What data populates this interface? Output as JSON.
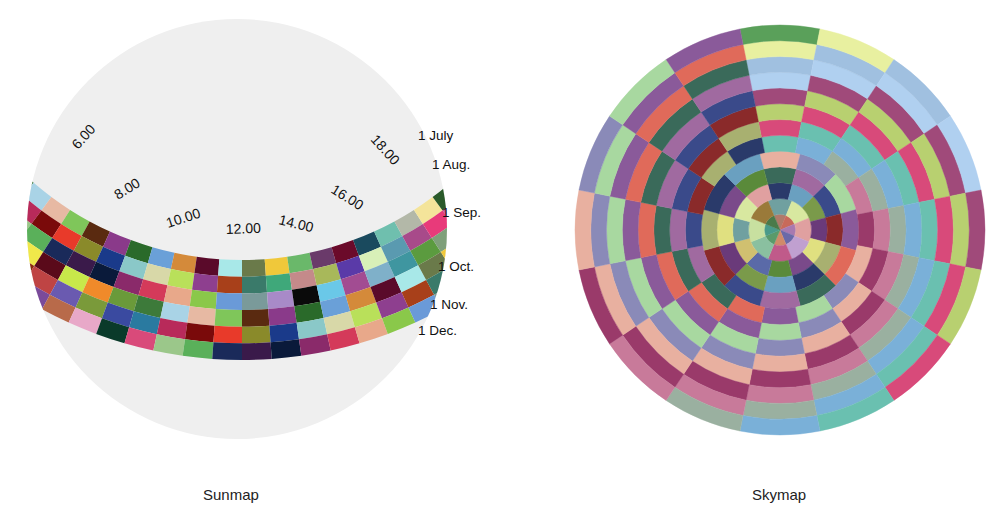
{
  "sunmap": {
    "caption": "Sunmap",
    "disc_color": "#efefef",
    "hour_labels": [
      "6.00",
      "8.00",
      "10.00",
      "12.00",
      "14.00",
      "16.00",
      "18.00"
    ],
    "month_labels": [
      "1 July",
      "1 Aug.",
      "1 Sep.",
      "1 Oct.",
      "1 Nov.",
      "1 Dec."
    ],
    "palette": [
      "#3d7a3a",
      "#6b0a2a",
      "#d94a7a",
      "#a24c92",
      "#3a3a8f",
      "#b9e05a",
      "#d7a2c2",
      "#a9d3e6",
      "#1a4a5e",
      "#9bc78a",
      "#7fb0c9",
      "#8c3f8f",
      "#8e3f8f",
      "#a3cf7a",
      "#e7b9a3",
      "#6fbfae",
      "#5ab05a",
      "#3f96a0",
      "#8a2c0c",
      "#a8401a",
      "#8a7a2a",
      "#7fc65a",
      "#b3b8a8",
      "#1a2a5a",
      "#5b9b3f",
      "#bf4444",
      "#3a7a6a",
      "#9a8ab5",
      "#5a2a10",
      "#f4e49a",
      "#3a1a4a",
      "#7fa07a",
      "#6a5ab0",
      "#3fa87a",
      "#8ac64a",
      "#8a3a8a",
      "#2a5a2a",
      "#0a1a3a",
      "#4a5a4a",
      "#7a9a3a",
      "#c48a8a",
      "#d4a46a",
      "#2a6a2a",
      "#d43a3a",
      "#8a2a6a",
      "#a8a8c8",
      "#3a4aa0",
      "#a8b85a",
      "#1a1a4a",
      "#6aa0d8",
      "#5a3a8a",
      "#d43a5a",
      "#4a5a6a",
      "#2a7aa0",
      "#5a3aa8",
      "#ffffff",
      "#d48a3a",
      "#a89a7a",
      "#e8a88a",
      "#a8d88a",
      "#b82a5a",
      "#d8f0b8",
      "#e84a1a",
      "#5a0a2a",
      "#a85aa8",
      "#8ac84a",
      "#5a0a6a",
      "#7a0a0a",
      "#5a9ab0",
      "#f0e84a",
      "#a8e8e8",
      "#3a9a4a",
      "#6a9ad8",
      "#4a3aa0",
      "#e83a2a",
      "#a84a8a",
      "#5a0a1a",
      "#6a7a4a",
      "#7a4a9a",
      "#7a9a9a",
      "#8a0a1a",
      "#8a8a2a",
      "#e83a7a",
      "#c8e84a",
      "#f0c83a",
      "#b86a4a",
      "#a88ac8",
      "#6a8ad8",
      "#1a3a8a",
      "#c85a9a",
      "#f08a2a",
      "#6ab86a",
      "#e8a8c8",
      "#0a0a0a",
      "#e8e8c8",
      "#8ac8c8",
      "#5a3a2a",
      "#6a9a3a",
      "#6a3a6a",
      "#0a3a2a",
      "#6ac8e8",
      "#1a5a8a",
      "#d8d8a8",
      "#c86a6a"
    ]
  },
  "skymap": {
    "caption": "Skymap",
    "rings": 13,
    "sectors_outer": 16,
    "palette": [
      "#b07a6a",
      "#7a4a8a",
      "#a8d8a0",
      "#e8f0a0",
      "#8ac0a0",
      "#6aa0c0",
      "#c87a9a",
      "#5a9a6a",
      "#d8e8a0",
      "#3a4a8a",
      "#d84a7a",
      "#c86a5a",
      "#5a8a3a",
      "#8a5a9a",
      "#a0c0e0",
      "#c8e0a0",
      "#7a9a4a",
      "#9a3a6a",
      "#4a9a8a",
      "#e0a0a0",
      "#8a2a2a",
      "#6ac0b0",
      "#a87ab0",
      "#5a6aa8",
      "#e06a5a",
      "#b0d0f0",
      "#9a7a3a",
      "#6a3a7a",
      "#e8b0a0",
      "#4a7a4a",
      "#c0a0d0",
      "#a8b070",
      "#7ab0d8",
      "#6a6aa8",
      "#d0c070",
      "#3a6a5a",
      "#a04a7a",
      "#b0e0e0",
      "#e0e080",
      "#8a8ab8",
      "#5aa05a",
      "#c05a8a",
      "#2a3a6a",
      "#9ab0a0",
      "#d08a6a",
      "#70a0a0",
      "#a06aa0",
      "#b8d070"
    ]
  }
}
